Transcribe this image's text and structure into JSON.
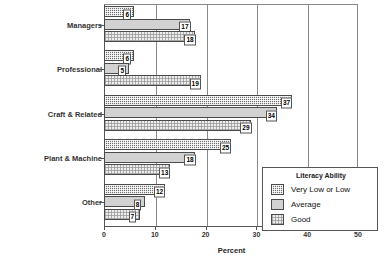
{
  "chart_data": {
    "type": "bar",
    "orientation": "horizontal",
    "title": "",
    "xlabel": "Percent",
    "ylabel": "",
    "xlim": [
      0,
      50
    ],
    "xticks": [
      0,
      10,
      20,
      30,
      40,
      50
    ],
    "xticklabels": [
      "0",
      "10",
      "20",
      "30",
      "40",
      "50"
    ],
    "gridlines": [
      10,
      20,
      30,
      40
    ],
    "grid": true,
    "categories": [
      "Managers",
      "Professional",
      "Craft & Related",
      "Plant & Machine",
      "Other"
    ],
    "legend_title": "Literacy Ability",
    "legend_position": "lower-right",
    "series": [
      {
        "name": "Very Low or Low",
        "values": [
          6,
          6,
          37,
          25,
          12
        ]
      },
      {
        "name": "Average",
        "values": [
          17,
          5,
          34,
          18,
          8
        ]
      },
      {
        "name": "Good",
        "values": [
          18,
          19,
          29,
          13,
          7
        ]
      }
    ]
  },
  "colors": {
    "series_very_low_or_low": "#6e6e6e",
    "series_average": "#d2d2d2",
    "series_good": "#ededed",
    "axis": "#555555",
    "grid": "#8a8a8a",
    "text": "#000000"
  }
}
